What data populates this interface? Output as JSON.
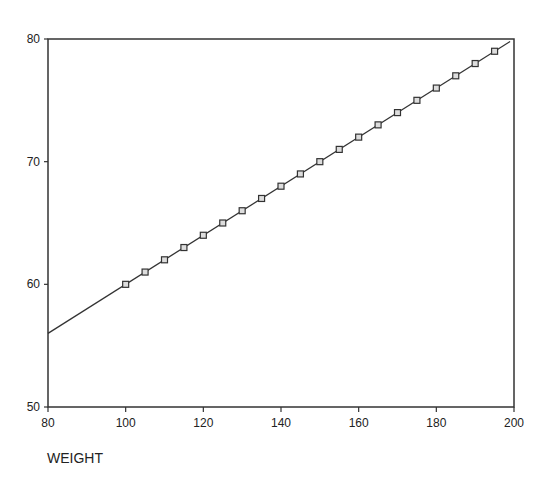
{
  "chart_data": {
    "type": "line",
    "title": "",
    "xlabel": "WEIGHT",
    "ylabel": "",
    "xlim": [
      80,
      200
    ],
    "ylim": [
      50,
      80
    ],
    "x_ticks": [
      80,
      100,
      120,
      140,
      160,
      180,
      200
    ],
    "y_ticks": [
      50,
      60,
      70,
      80
    ],
    "grid": false,
    "legend": null,
    "series": [
      {
        "name": "data points",
        "style": "square-markers",
        "x": [
          100,
          105,
          110,
          115,
          120,
          125,
          130,
          135,
          140,
          145,
          150,
          155,
          160,
          165,
          170,
          175,
          180,
          185,
          190,
          195
        ],
        "y": [
          60,
          61,
          62,
          63,
          64,
          65,
          66,
          67,
          68,
          69,
          70,
          71,
          72,
          73,
          74,
          75,
          76,
          77,
          78,
          79
        ]
      },
      {
        "name": "fitted line",
        "style": "line",
        "x": [
          80,
          199
        ],
        "y": [
          56,
          79.8
        ]
      }
    ]
  }
}
